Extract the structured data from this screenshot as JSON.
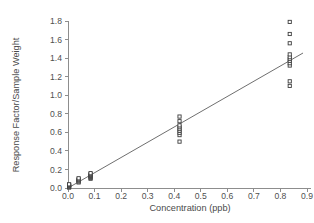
{
  "chart_data": {
    "type": "scatter",
    "title": "",
    "xlabel": "Concentration (ppb)",
    "ylabel": "Response Factor/Sample Weight",
    "xlim": [
      0.0,
      0.9
    ],
    "ylim": [
      0.0,
      1.8
    ],
    "xticks": [
      "0.0",
      "0.1",
      "0.2",
      "0.3",
      "0.4",
      "0.5",
      "0.6",
      "0.7",
      "0.8",
      "0.9"
    ],
    "xtick_values": [
      0.0,
      0.1,
      0.2,
      0.3,
      0.4,
      0.5,
      0.6,
      0.7,
      0.8,
      0.9
    ],
    "yticks": [
      "0.0",
      "0.2",
      "0.4",
      "0.6",
      "0.8",
      "1.0",
      "1.2",
      "1.4",
      "1.6",
      "1.8"
    ],
    "ytick_values": [
      0.0,
      0.2,
      0.4,
      0.6,
      0.8,
      1.0,
      1.2,
      1.4,
      1.6,
      1.8
    ],
    "grid": false,
    "legend": false,
    "legend_position": "none",
    "marker": "open-square",
    "marker_size": 3.2,
    "series": [
      {
        "name": "Calibration points",
        "x": [
          0.004,
          0.004,
          0.004,
          0.004,
          0.004,
          0.004,
          0.004,
          0.004,
          0.04,
          0.04,
          0.04,
          0.04,
          0.04,
          0.04,
          0.085,
          0.085,
          0.085,
          0.085,
          0.085,
          0.085,
          0.085,
          0.42,
          0.42,
          0.42,
          0.42,
          0.42,
          0.42,
          0.42,
          0.42,
          0.42,
          0.835,
          0.835,
          0.835,
          0.835,
          0.835,
          0.835,
          0.835,
          0.835,
          0.835,
          0.835,
          0.835
        ],
        "y": [
          0.005,
          0.01,
          0.015,
          0.02,
          0.025,
          0.03,
          0.035,
          0.04,
          0.06,
          0.07,
          0.08,
          0.085,
          0.095,
          0.105,
          0.1,
          0.11,
          0.12,
          0.13,
          0.14,
          0.15,
          0.16,
          0.5,
          0.57,
          0.595,
          0.615,
          0.635,
          0.655,
          0.675,
          0.72,
          0.77,
          1.1,
          1.15,
          1.32,
          1.345,
          1.37,
          1.39,
          1.41,
          1.44,
          1.56,
          1.66,
          1.79
        ]
      }
    ],
    "fit_line": {
      "type": "linear-regression",
      "x_start": 0.0,
      "y_start": 0.0,
      "x_end": 0.885,
      "y_end": 1.455,
      "slope": 1.644,
      "intercept": 0.0
    }
  }
}
